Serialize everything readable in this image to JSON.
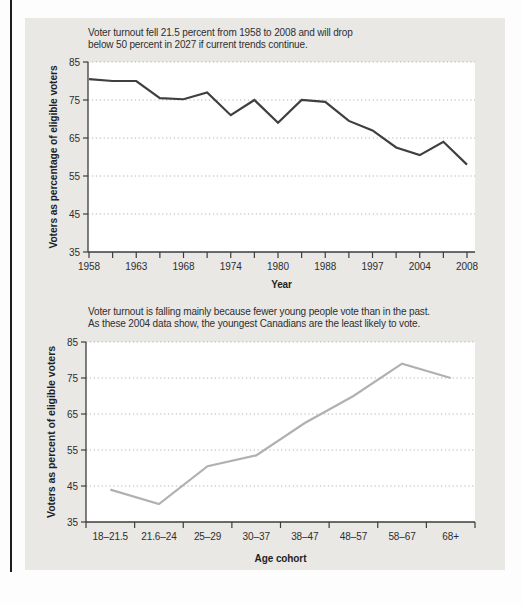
{
  "page": {
    "background": "#fdfdfd",
    "panel_color": "#e9e8e5",
    "left_rule_color": "#1c1c1c",
    "plot_background": "#ffffff",
    "grid_color": "#b6b6b6",
    "axis_color": "#3c3c3c"
  },
  "chart_data": [
    {
      "type": "line",
      "caption_lines": [
        "Voter turnout fell 21.5 percent from 1958 to 2008 and will drop",
        "below 50 percent in 2027 if current trends continue."
      ],
      "ylabel": "Voters as percentage of eligible voters",
      "xlabel": "Year",
      "ylim": [
        35,
        85
      ],
      "yticks": [
        85,
        75,
        65,
        55,
        45,
        35
      ],
      "grid": true,
      "legend": "none",
      "x": [
        1958,
        1962,
        1963,
        1965,
        1968,
        1972,
        1974,
        1979,
        1980,
        1984,
        1988,
        1993,
        1997,
        2000,
        2004,
        2006,
        2008
      ],
      "x_labeled_ticks": [
        "1958",
        "1963",
        "1968",
        "1974",
        "1980",
        "1988",
        "1997",
        "2004",
        "2008"
      ],
      "values": [
        80.5,
        80,
        80,
        75.5,
        75.2,
        77,
        71,
        75,
        69,
        75,
        74.5,
        69.5,
        67,
        62.5,
        60.5,
        64,
        58
      ],
      "line_color": "#3f3f3f"
    },
    {
      "type": "line",
      "caption_lines": [
        "Voter turnout is falling mainly because fewer young people vote than in the past.",
        "As these 2004 data show, the youngest Canadians are the least likely to vote."
      ],
      "ylabel": "Voters as percent of eligible voters",
      "xlabel": "Age cohort",
      "ylim": [
        35,
        85
      ],
      "yticks": [
        85,
        75,
        65,
        55,
        45,
        35
      ],
      "grid": true,
      "legend": "none",
      "categories": [
        "18–21.5",
        "21.6–24",
        "25–29",
        "30–37",
        "38–47",
        "48–57",
        "58–67",
        "68+"
      ],
      "values": [
        44,
        40,
        50.5,
        53.5,
        62.5,
        70,
        79,
        75
      ],
      "line_color": "#b3b0ad"
    }
  ]
}
